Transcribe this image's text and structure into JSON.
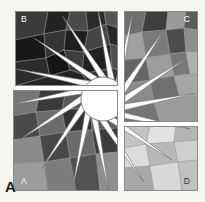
{
  "figure": {
    "caption_label": "A",
    "background_color": "#f7f5f0",
    "gutter_color": "#ffffff",
    "border_color": "#8a8a8a",
    "frame": {
      "x": 13,
      "y": 11,
      "width": 185,
      "height": 180
    }
  },
  "panels": [
    {
      "id": "panel-b",
      "label": "B",
      "position": "top-left",
      "label_color": "#ffffff",
      "label_x": 21,
      "label_y": 22,
      "tone": "very-dark",
      "rect": {
        "x": 15,
        "y": 11,
        "width": 103,
        "height": 75
      },
      "base_color": "#2e2e2e",
      "tiles": [
        {
          "points": "15,11 48,11 44,34 15,40",
          "fill": "#3a3a3a"
        },
        {
          "points": "48,11 70,11 66,30 44,34",
          "fill": "#232323"
        },
        {
          "points": "70,11 86,11 88,31 66,30",
          "fill": "#4a4a4a"
        },
        {
          "points": "86,11 104,11 106,24 88,31",
          "fill": "#2a2a2a"
        },
        {
          "points": "104,11 118,11 118,28 106,24",
          "fill": "#565656"
        },
        {
          "points": "15,40 44,34 46,58 15,62",
          "fill": "#181818"
        },
        {
          "points": "44,34 66,30 64,50 46,58",
          "fill": "#343434"
        },
        {
          "points": "66,30 88,31 84,52 64,50",
          "fill": "#1e1e1e"
        },
        {
          "points": "88,31 106,24 110,44 84,52",
          "fill": "#444444"
        },
        {
          "points": "106,24 118,28 118,46 110,44",
          "fill": "#272727"
        },
        {
          "points": "15,62 46,58 50,76 15,86",
          "fill": "#2c2c2c"
        },
        {
          "points": "46,58 64,50 70,70 50,76",
          "fill": "#151515"
        },
        {
          "points": "64,50 84,52 82,74 70,70",
          "fill": "#3d3d3d"
        },
        {
          "points": "84,52 110,44 112,68 82,74",
          "fill": "#202020"
        },
        {
          "points": "110,44 118,46 118,70 112,68",
          "fill": "#4e4e4e"
        },
        {
          "points": "50,76 70,70 82,74 90,86 15,86",
          "fill": "#242424"
        },
        {
          "points": "82,74 112,68 118,70 118,86 90,86",
          "fill": "#363636"
        }
      ]
    },
    {
      "id": "panel-c",
      "label": "C",
      "position": "top-right",
      "label_color": "#ffffff",
      "label_x": 190,
      "label_y": 22,
      "tone": "medium",
      "rect": {
        "x": 124,
        "y": 11,
        "width": 74,
        "height": 111
      },
      "base_color": "#8c8c8c",
      "tiles": [
        {
          "points": "124,11 146,11 142,32 124,36",
          "fill": "#6f6f6f"
        },
        {
          "points": "146,11 168,11 166,30 142,32",
          "fill": "#3e3e3e"
        },
        {
          "points": "168,11 186,11 184,28 166,30",
          "fill": "#9a9a9a"
        },
        {
          "points": "186,11 198,11 198,30 184,28",
          "fill": "#5c5c5c"
        },
        {
          "points": "124,36 142,32 146,58 124,60",
          "fill": "#a0a0a0"
        },
        {
          "points": "142,32 166,30 170,54 146,58",
          "fill": "#7a7a7a"
        },
        {
          "points": "166,30 184,28 186,52 170,54",
          "fill": "#4c4c4c"
        },
        {
          "points": "184,28 198,30 198,52 186,52",
          "fill": "#8e8e8e"
        },
        {
          "points": "124,60 146,58 150,80 124,84",
          "fill": "#656565"
        },
        {
          "points": "146,58 170,54 174,76 150,80",
          "fill": "#9d9d9d"
        },
        {
          "points": "170,54 186,52 190,74 174,76",
          "fill": "#787878"
        },
        {
          "points": "186,52 198,52 198,74 190,74",
          "fill": "#b0b0b0"
        },
        {
          "points": "124,84 150,80 154,102 124,104",
          "fill": "#8b8b8b"
        },
        {
          "points": "150,80 174,76 180,98 154,102",
          "fill": "#707070"
        },
        {
          "points": "174,76 190,74 198,74 198,96 180,98",
          "fill": "#a6a6a6"
        },
        {
          "points": "124,104 154,102 160,122 124,122",
          "fill": "#757575"
        },
        {
          "points": "154,102 180,98 198,96 198,122 160,122",
          "fill": "#9b9b9b"
        }
      ]
    },
    {
      "id": "panel-a",
      "label": "A",
      "position": "bottom-left",
      "label_color": "#ffffff",
      "label_x": 21,
      "label_y": 184,
      "tone": "dark-medium",
      "rect": {
        "x": 13,
        "y": 90,
        "width": 105,
        "height": 101
      },
      "base_color": "#5a5a5a",
      "tiles": [
        {
          "points": "13,90 40,90 36,112 13,116",
          "fill": "#767676"
        },
        {
          "points": "40,90 66,90 62,110 36,112",
          "fill": "#3a3a3a"
        },
        {
          "points": "66,90 92,90 90,108 62,110",
          "fill": "#585858"
        },
        {
          "points": "92,90 118,90 118,106 90,108",
          "fill": "#2b2b2b"
        },
        {
          "points": "13,116 36,112 40,136 13,140",
          "fill": "#4a4a4a"
        },
        {
          "points": "36,112 62,110 66,132 40,136",
          "fill": "#6c6c6c"
        },
        {
          "points": "62,110 90,108 92,130 66,132",
          "fill": "#343434"
        },
        {
          "points": "90,108 118,106 118,128 92,130",
          "fill": "#5e5e5e"
        },
        {
          "points": "13,140 40,136 44,162 13,164",
          "fill": "#8a8a8a"
        },
        {
          "points": "40,136 66,132 70,158 44,162",
          "fill": "#474747"
        },
        {
          "points": "66,132 92,130 96,154 70,158",
          "fill": "#6a6a6a"
        },
        {
          "points": "92,130 118,128 118,152 96,154",
          "fill": "#3c3c3c"
        },
        {
          "points": "13,164 44,162 48,191 13,191",
          "fill": "#9c9c9c"
        },
        {
          "points": "44,162 70,158 76,191 48,191",
          "fill": "#7d7d7d"
        },
        {
          "points": "70,158 96,154 100,191 76,191",
          "fill": "#525252"
        },
        {
          "points": "96,154 118,152 118,191 100,191",
          "fill": "#8f8f8f"
        }
      ]
    },
    {
      "id": "panel-d",
      "label": "D",
      "position": "bottom-right",
      "label_color": "#2b2b2b",
      "label_x": 190,
      "label_y": 184,
      "tone": "light",
      "rect": {
        "x": 124,
        "y": 126,
        "width": 74,
        "height": 65
      },
      "base_color": "#d2d2d2",
      "tiles": [
        {
          "points": "124,126 150,126 146,144 124,148",
          "fill": "#c4c4c4"
        },
        {
          "points": "150,126 176,126 174,142 146,144",
          "fill": "#e2e2e2"
        },
        {
          "points": "176,126 198,126 198,140 174,142",
          "fill": "#b4b4b4"
        },
        {
          "points": "124,148 146,144 150,166 124,168",
          "fill": "#dcdcdc"
        },
        {
          "points": "146,144 174,142 178,162 150,166",
          "fill": "#b8b8b8"
        },
        {
          "points": "174,142 198,140 198,160 178,162",
          "fill": "#cfcfcf"
        },
        {
          "points": "124,168 150,166 154,191 124,191",
          "fill": "#a8a8a8"
        },
        {
          "points": "150,166 178,162 182,191 154,191",
          "fill": "#d8d8d8"
        },
        {
          "points": "178,162 198,160 198,191 182,191",
          "fill": "#c0c0c0"
        }
      ]
    }
  ],
  "star": {
    "center_x": 103,
    "center_y": 99,
    "hub_radius": 22,
    "blade_count": 16,
    "blade_color": "#ffffff",
    "stroke_color": "#6e6e6e",
    "outer_radius": 92,
    "twist_degrees": 26
  },
  "gutters": [
    {
      "name": "gutter-vertical-upper",
      "x": 118,
      "y": 11,
      "width": 6,
      "height": 111
    },
    {
      "name": "gutter-vertical-lower",
      "x": 118,
      "y": 122,
      "width": 6,
      "height": 69
    },
    {
      "name": "gutter-horizontal-left",
      "x": 13,
      "y": 86,
      "width": 105,
      "height": 4
    },
    {
      "name": "gutter-horizontal-right",
      "x": 124,
      "y": 122,
      "width": 74,
      "height": 4
    }
  ]
}
